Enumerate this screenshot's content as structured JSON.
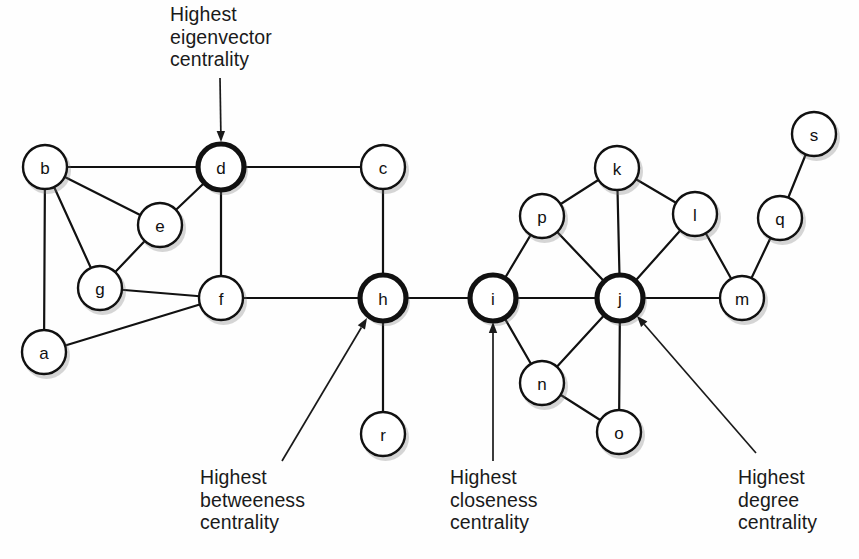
{
  "figure": {
    "width": 859,
    "height": 559,
    "background_color": "#fefefe",
    "node_fill_color": "#ffffff",
    "node_stroke_color": "#111111",
    "edge_color": "#111111",
    "text_color": "#1a1a1a"
  },
  "graph": {
    "type": "node-link-diagram",
    "node_radius": 22,
    "highlighted_node_radius": 23,
    "nodes": [
      {
        "id": "a",
        "label": "a",
        "x": 44,
        "y": 352,
        "highlighted": false
      },
      {
        "id": "b",
        "label": "b",
        "x": 45,
        "y": 167,
        "highlighted": false
      },
      {
        "id": "c",
        "label": "c",
        "x": 383,
        "y": 167,
        "highlighted": false
      },
      {
        "id": "d",
        "label": "d",
        "x": 221,
        "y": 167,
        "highlighted": true
      },
      {
        "id": "e",
        "label": "e",
        "x": 160,
        "y": 225,
        "highlighted": false
      },
      {
        "id": "f",
        "label": "f",
        "x": 221,
        "y": 298,
        "highlighted": false
      },
      {
        "id": "g",
        "label": "g",
        "x": 100,
        "y": 288,
        "highlighted": false
      },
      {
        "id": "h",
        "label": "h",
        "x": 383,
        "y": 298,
        "highlighted": true
      },
      {
        "id": "i",
        "label": "i",
        "x": 493,
        "y": 298,
        "highlighted": true
      },
      {
        "id": "j",
        "label": "j",
        "x": 620,
        "y": 298,
        "highlighted": true
      },
      {
        "id": "k",
        "label": "k",
        "x": 617,
        "y": 168,
        "highlighted": false
      },
      {
        "id": "l",
        "label": "l",
        "x": 695,
        "y": 214,
        "highlighted": false
      },
      {
        "id": "m",
        "label": "m",
        "x": 742,
        "y": 298,
        "highlighted": false
      },
      {
        "id": "n",
        "label": "n",
        "x": 542,
        "y": 383,
        "highlighted": false
      },
      {
        "id": "o",
        "label": "o",
        "x": 619,
        "y": 432,
        "highlighted": false
      },
      {
        "id": "p",
        "label": "p",
        "x": 542,
        "y": 216,
        "highlighted": false
      },
      {
        "id": "q",
        "label": "q",
        "x": 780,
        "y": 218,
        "highlighted": false
      },
      {
        "id": "r",
        "label": "r",
        "x": 383,
        "y": 434,
        "highlighted": false
      },
      {
        "id": "s",
        "label": "s",
        "x": 814,
        "y": 134,
        "highlighted": false
      }
    ],
    "edges": [
      {
        "source": "b",
        "target": "d"
      },
      {
        "source": "b",
        "target": "e"
      },
      {
        "source": "b",
        "target": "g"
      },
      {
        "source": "b",
        "target": "a"
      },
      {
        "source": "d",
        "target": "e"
      },
      {
        "source": "d",
        "target": "c"
      },
      {
        "source": "d",
        "target": "f"
      },
      {
        "source": "e",
        "target": "g"
      },
      {
        "source": "g",
        "target": "f"
      },
      {
        "source": "a",
        "target": "f"
      },
      {
        "source": "c",
        "target": "h"
      },
      {
        "source": "f",
        "target": "h"
      },
      {
        "source": "h",
        "target": "r"
      },
      {
        "source": "h",
        "target": "i"
      },
      {
        "source": "i",
        "target": "p"
      },
      {
        "source": "i",
        "target": "j"
      },
      {
        "source": "i",
        "target": "n"
      },
      {
        "source": "p",
        "target": "k"
      },
      {
        "source": "p",
        "target": "j"
      },
      {
        "source": "k",
        "target": "j"
      },
      {
        "source": "k",
        "target": "l"
      },
      {
        "source": "l",
        "target": "j"
      },
      {
        "source": "l",
        "target": "m"
      },
      {
        "source": "j",
        "target": "m"
      },
      {
        "source": "j",
        "target": "n"
      },
      {
        "source": "j",
        "target": "o"
      },
      {
        "source": "n",
        "target": "o"
      },
      {
        "source": "m",
        "target": "q"
      },
      {
        "source": "q",
        "target": "s"
      }
    ]
  },
  "annotations": [
    {
      "id": "eigenvector",
      "text": "Highest\neigenvector\ncentrality",
      "target_node": "d",
      "text_x": 170,
      "text_y": 3,
      "text_align": "left",
      "arrow_from_x": 220,
      "arrow_from_y": 78,
      "arrow_to_x": 221,
      "arrow_to_y": 142
    },
    {
      "id": "betweeness",
      "text": "Highest\nbetweeness\ncentrality",
      "target_node": "h",
      "text_x": 200,
      "text_y": 466,
      "text_align": "left",
      "arrow_from_x": 282,
      "arrow_from_y": 461,
      "arrow_to_x": 367,
      "arrow_to_y": 318
    },
    {
      "id": "closeness",
      "text": "Highest\ncloseness\ncentrality",
      "target_node": "i",
      "text_x": 450,
      "text_y": 466,
      "text_align": "left",
      "arrow_from_x": 493,
      "arrow_from_y": 461,
      "arrow_to_x": 493,
      "arrow_to_y": 322
    },
    {
      "id": "degree",
      "text": "Highest\ndegree\ncentrality",
      "target_node": "j",
      "text_x": 738,
      "text_y": 466,
      "text_align": "left",
      "arrow_from_x": 756,
      "arrow_from_y": 453,
      "arrow_to_x": 637,
      "arrow_to_y": 316
    }
  ]
}
